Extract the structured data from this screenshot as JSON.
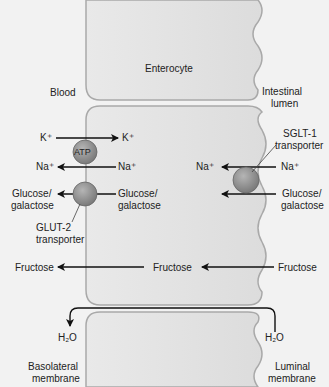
{
  "diagram": {
    "title_cell": "Enterocyte",
    "regions": {
      "blood": "Blood",
      "lumen_line1": "Intestinal",
      "lumen_line2": "lumen"
    },
    "pump": {
      "label": "ATP",
      "k_left": "K⁺",
      "k_right": "K⁺",
      "na_left": "Na⁺",
      "na_right": "Na⁺"
    },
    "glut2": {
      "left_line1": "Glucose/",
      "left_line2": "galactose",
      "right_line1": "Glucose/",
      "right_line2": "galactose",
      "name_line1": "GLUT-2",
      "name_line2": "transporter"
    },
    "sglt1": {
      "name_line1": "SGLT-1",
      "name_line2": "transporter",
      "na_left": "Na⁺",
      "na_right": "Na⁺",
      "glu_line1": "Glucose/",
      "glu_line2": "galactose"
    },
    "fructose": {
      "left": "Fructose",
      "middle": "Fructose",
      "right": "Fructose"
    },
    "water": {
      "left": "H₂O",
      "right": "H₂O"
    },
    "membranes": {
      "basolateral_line1": "Basolateral",
      "basolateral_line2": "membrane",
      "luminal_line1": "Luminal",
      "luminal_line2": "membrane"
    },
    "colors": {
      "membrane": "#a9a9a9",
      "cell_fill": "#e4e4e4",
      "transporter": "#8c8c8c",
      "arrow": "#111111"
    }
  }
}
